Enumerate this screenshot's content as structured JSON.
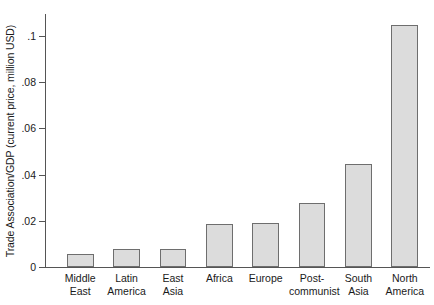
{
  "chart_data": {
    "type": "bar",
    "title": "",
    "subtitle": "",
    "xlabel": "",
    "ylabel": "Trade Association/GDP (current price, million USD)",
    "categories": [
      "Middle\nEast",
      "Latin\nAmerica",
      "East\nAsia",
      "Africa",
      "Europe",
      "Post-\ncommunist",
      "South\nAsia",
      "North\nAmerica"
    ],
    "values": [
      0.0055,
      0.008,
      0.008,
      0.0185,
      0.019,
      0.0275,
      0.0445,
      0.1045
    ],
    "ylim": [
      0,
      0.112
    ],
    "yticks": [
      0,
      0.02,
      0.04,
      0.06,
      0.08,
      0.1
    ],
    "ytick_labels": [
      "0",
      ".02",
      ".04",
      ".06",
      ".08",
      ".1"
    ],
    "grid": false,
    "legend": null,
    "bar_fill_color": "#dcdcdc",
    "bar_edge_color": "#6e6e6e",
    "axis_color": "#555555"
  }
}
